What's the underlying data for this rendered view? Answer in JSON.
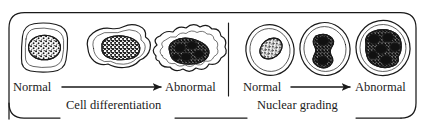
{
  "figure": {
    "name": "cell-differentiation-and-nuclear-grading",
    "background_color": "#ffffff",
    "ink_color": "#1a1a1a",
    "width": 425,
    "height": 122
  },
  "panels": [
    {
      "id": "cell-differentiation",
      "caption": "Cell differentiation",
      "start_label": "Normal",
      "end_label": "Abnormal",
      "cells": [
        {
          "name": "normal-cell",
          "cell_shape": "rounded square",
          "nucleus_shape": "small round stippled nucleus, centered"
        },
        {
          "name": "intermediate-cell",
          "cell_shape": "irregular lobed blob",
          "nucleus_shape": "enlarged irregular stippled nucleus"
        },
        {
          "name": "abnormal-cell",
          "cell_shape": "highly irregular spiky elongated outline",
          "nucleus_shape": "large dense dark clumped nucleus"
        }
      ]
    },
    {
      "id": "nuclear-grading",
      "caption": "Nuclear grading",
      "start_label": "Normal",
      "end_label": "Abnormal",
      "cells": [
        {
          "name": "normal-nucleus-cell",
          "cell_shape": "oval cell",
          "nucleus_shape": "small oval stippled nucleus"
        },
        {
          "name": "bilobed-nucleus-cell",
          "cell_shape": "oval cell",
          "nucleus_shape": "bilobed dumbbell-shaped dark nucleus"
        },
        {
          "name": "abnormal-nucleus-cell",
          "cell_shape": "oval cell",
          "nucleus_shape": "large irregular very dark nucleus filling cell"
        }
      ]
    }
  ],
  "labels": {
    "normal_left": "Normal",
    "abnormal_left": "Abnormal",
    "normal_right": "Normal",
    "abnormal_right": "Abnormal",
    "caption_left": "Cell differentiation",
    "caption_right": "Nuclear grading"
  },
  "arrows": [
    {
      "name": "differentiation-arrow",
      "direction": "right"
    },
    {
      "name": "nuclear-grading-arrow",
      "direction": "right"
    }
  ],
  "divider": {
    "name": "panel-divider",
    "orientation": "vertical"
  }
}
